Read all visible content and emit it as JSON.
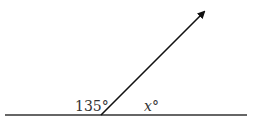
{
  "diagram": {
    "type": "angle-on-straight-line",
    "labels": {
      "left_angle": "135°",
      "right_angle_var": "x",
      "right_angle_deg": "°"
    },
    "geometry": {
      "base_line": {
        "x1": 5,
        "y1": 115,
        "x2": 247,
        "y2": 115
      },
      "ray": {
        "x1": 101,
        "y1": 115,
        "x2": 206,
        "y2": 10
      },
      "stroke_color": "#222222"
    }
  }
}
